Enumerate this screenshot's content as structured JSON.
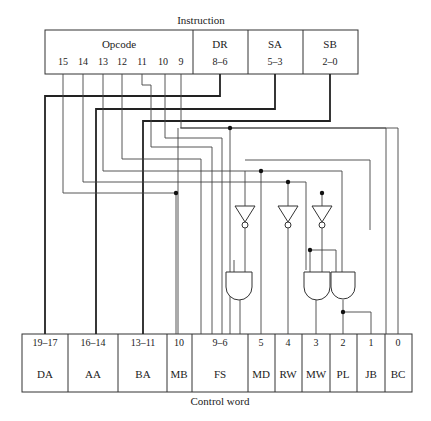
{
  "instruction": {
    "title": "Instruction",
    "fields": [
      {
        "name": "Opcode",
        "bits": [
          "15",
          "14",
          "13",
          "12",
          "11",
          "10",
          "9"
        ]
      },
      {
        "name": "DR",
        "range": "8–6"
      },
      {
        "name": "SA",
        "range": "5–3"
      },
      {
        "name": "SB",
        "range": "2–0"
      }
    ]
  },
  "control_word": {
    "title": "Control word",
    "fields": [
      {
        "name": "DA",
        "range": "19–17"
      },
      {
        "name": "AA",
        "range": "16–14"
      },
      {
        "name": "BA",
        "range": "13–11"
      },
      {
        "name": "MB",
        "range": "10"
      },
      {
        "name": "FS",
        "range": "9–6"
      },
      {
        "name": "MD",
        "range": "5"
      },
      {
        "name": "RW",
        "range": "4"
      },
      {
        "name": "MW",
        "range": "3"
      },
      {
        "name": "PL",
        "range": "2"
      },
      {
        "name": "JB",
        "range": "1"
      },
      {
        "name": "BC",
        "range": "0"
      }
    ]
  },
  "logic": {
    "inverters": 3,
    "and_gates": 3
  }
}
